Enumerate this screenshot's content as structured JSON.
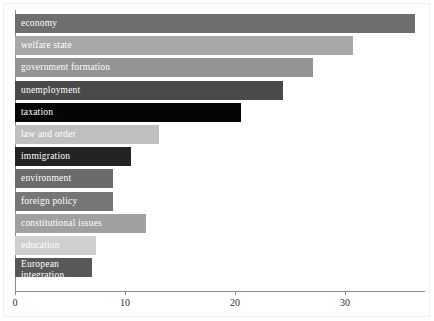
{
  "chart_data": {
    "type": "bar",
    "orientation": "horizontal",
    "title": "",
    "subtitle": "",
    "xlabel": "",
    "ylabel": "",
    "xlim": [
      0,
      37.5
    ],
    "xticks": [
      0,
      10,
      20,
      30
    ],
    "xtick_labels": [
      "0",
      "10",
      "20",
      "30"
    ],
    "grid": false,
    "legend": null,
    "categories": [
      "economy",
      "welfare state",
      "government formation",
      "unemployment",
      "taxation",
      "law and order",
      "immigration",
      "environment",
      "foreign policy",
      "constitutional issues",
      "education",
      "European integration"
    ],
    "values": [
      36.4,
      30.7,
      27.1,
      24.4,
      20.5,
      13.1,
      10.5,
      8.9,
      8.9,
      11.9,
      7.4,
      7.0
    ],
    "bar_colors": [
      "#6e6e6e",
      "#a8a8a8",
      "#939393",
      "#4a4a4a",
      "#050505",
      "#bfbfbf",
      "#232323",
      "#6b6b6b",
      "#767676",
      "#a0a0a0",
      "#cfcfcf",
      "#585858"
    ],
    "label_colors": [
      "#ffffff",
      "#ffffff",
      "#ffffff",
      "#ffffff",
      "#ffffff",
      "#ffffff",
      "#ffffff",
      "#ffffff",
      "#ffffff",
      "#ffffff",
      "#ffffff",
      "#ffffff"
    ]
  }
}
